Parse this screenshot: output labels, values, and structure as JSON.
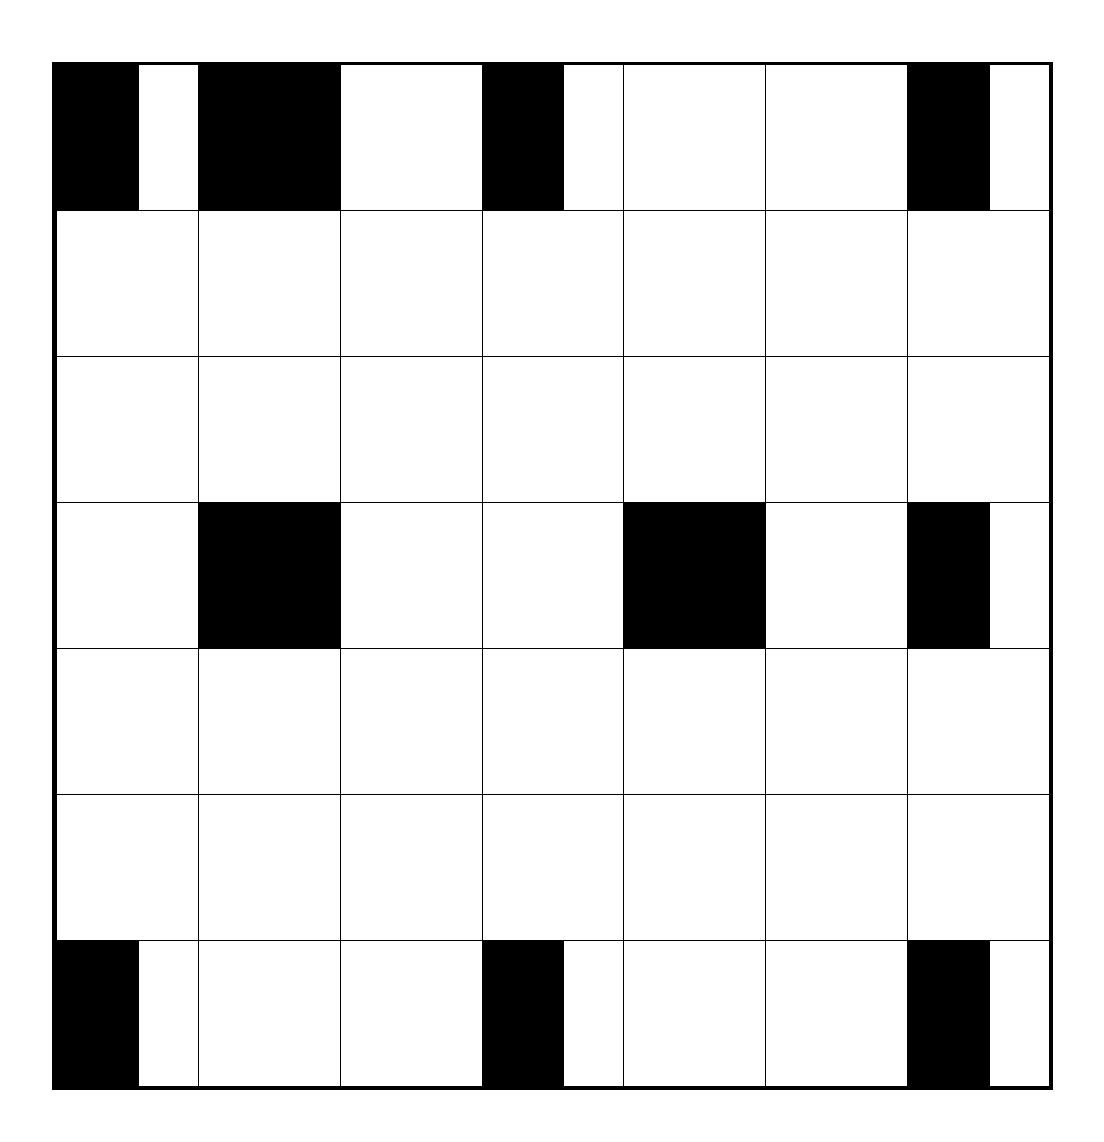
{
  "diagram": {
    "type": "grid",
    "rows": 7,
    "cols": 7,
    "colors": {
      "line": "#000000",
      "background": "#ffffff",
      "filled": "#000000"
    },
    "cells": [
      {
        "row": 0,
        "col": 0,
        "fill": "partial"
      },
      {
        "row": 0,
        "col": 1,
        "fill": "full"
      },
      {
        "row": 0,
        "col": 3,
        "fill": "partial"
      },
      {
        "row": 0,
        "col": 6,
        "fill": "partial"
      },
      {
        "row": 3,
        "col": 1,
        "fill": "full"
      },
      {
        "row": 3,
        "col": 4,
        "fill": "full"
      },
      {
        "row": 3,
        "col": 6,
        "fill": "partial"
      },
      {
        "row": 6,
        "col": 0,
        "fill": "partial"
      },
      {
        "row": 6,
        "col": 3,
        "fill": "partial"
      },
      {
        "row": 6,
        "col": 6,
        "fill": "partial"
      }
    ],
    "partial_fraction": 0.58
  }
}
